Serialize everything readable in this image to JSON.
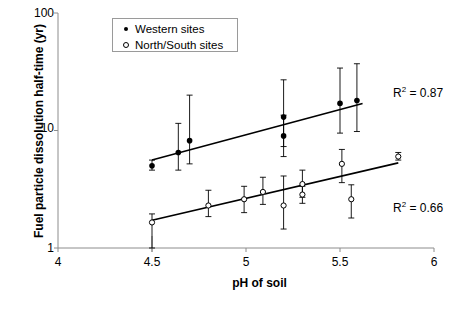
{
  "chart_data": {
    "type": "scatter",
    "title": "",
    "xlabel": "pH of soil",
    "ylabel": "Fuel particle dissolution half-time (yr)",
    "xlim": [
      4,
      6
    ],
    "ylim": [
      1,
      100
    ],
    "yscale": "log",
    "xscale": "linear",
    "xticks": [
      "4",
      "4.5",
      "5",
      "5.5",
      "6"
    ],
    "xtick_values": [
      4,
      4.5,
      5,
      5.5,
      6
    ],
    "yticks": [
      "1",
      "10",
      "100"
    ],
    "ytick_values": [
      1,
      10,
      100
    ],
    "grid": false,
    "legend_position": "top-center",
    "series": [
      {
        "name": "Western sites",
        "marker": "filled-circle",
        "points": [
          {
            "x": 4.5,
            "y": 5.0,
            "yerr_low": 4.6,
            "yerr_high": 5.6
          },
          {
            "x": 4.64,
            "y": 6.5,
            "yerr_low": 4.6,
            "yerr_high": 11.5
          },
          {
            "x": 4.7,
            "y": 8.2,
            "yerr_low": 5.2,
            "yerr_high": 20.0
          },
          {
            "x": 5.2,
            "y": 9.0,
            "yerr_low": 6.0,
            "yerr_high": 13.5
          },
          {
            "x": 5.2,
            "y": 13.0,
            "yerr_low": 7.3,
            "yerr_high": 27.0
          },
          {
            "x": 5.5,
            "y": 17.0,
            "yerr_low": 9.5,
            "yerr_high": 34.0
          },
          {
            "x": 5.59,
            "y": 18.0,
            "yerr_low": 9.8,
            "yerr_high": 37.0
          }
        ],
        "fit_line": {
          "x1": 4.5,
          "y1": 5.6,
          "x2": 5.62,
          "y2": 17.0
        },
        "r_squared": "0.87"
      },
      {
        "name": "North/South sites",
        "marker": "open-circle",
        "points": [
          {
            "x": 4.5,
            "y": 1.65,
            "yerr_low": 1.0,
            "yerr_high": 1.95
          },
          {
            "x": 4.8,
            "y": 2.3,
            "yerr_low": 1.85,
            "yerr_high": 3.1
          },
          {
            "x": 4.99,
            "y": 2.6,
            "yerr_low": 2.0,
            "yerr_high": 3.35
          },
          {
            "x": 5.09,
            "y": 3.0,
            "yerr_low": 2.35,
            "yerr_high": 4.0
          },
          {
            "x": 5.2,
            "y": 2.3,
            "yerr_low": 1.45,
            "yerr_high": 4.1
          },
          {
            "x": 5.3,
            "y": 3.5,
            "yerr_low": 2.7,
            "yerr_high": 4.6
          },
          {
            "x": 5.3,
            "y": 2.85,
            "yerr_low": 2.4,
            "yerr_high": 3.35
          },
          {
            "x": 5.51,
            "y": 5.2,
            "yerr_low": 3.6,
            "yerr_high": 6.9
          },
          {
            "x": 5.56,
            "y": 2.6,
            "yerr_low": 1.8,
            "yerr_high": 3.45
          },
          {
            "x": 5.81,
            "y": 6.0,
            "yerr_low": 5.6,
            "yerr_high": 6.5
          }
        ],
        "fit_line": {
          "x1": 4.5,
          "y1": 1.72,
          "x2": 5.81,
          "y2": 5.3
        },
        "r_squared": "0.66"
      }
    ],
    "annotations": [
      {
        "id": "r2-western",
        "text": "R² = 0.87"
      },
      {
        "id": "r2-ns",
        "text": "R² = 0.66"
      }
    ]
  },
  "legend": {
    "entries": [
      {
        "label": "Western sites",
        "marker": "filled-circle"
      },
      {
        "label": "North/South sites",
        "marker": "open-circle"
      }
    ]
  },
  "annotations": {
    "r2_western_prefix": "R",
    "r2_western_sup": "2",
    "r2_western_value": " = 0.87",
    "r2_ns_prefix": "R",
    "r2_ns_sup": "2",
    "r2_ns_value": " = 0.66"
  },
  "axes": {
    "x_title": "pH of soil",
    "y_title": "Fuel particle dissolution half-time (yr)",
    "x_ticks": [
      "4",
      "4.5",
      "5",
      "5.5",
      "6"
    ],
    "y_ticks": [
      "100",
      "10",
      "1"
    ]
  },
  "colors": {
    "axis": "#8c8c8c",
    "data": "#000000",
    "legend_border": "#9a9a9a",
    "background": "#ffffff"
  }
}
